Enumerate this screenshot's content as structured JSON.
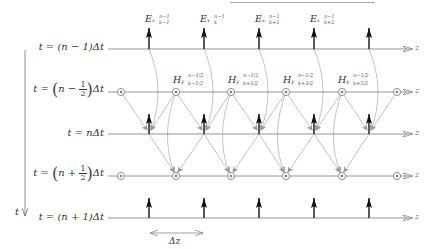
{
  "figure": {
    "title": "",
    "colors": {
      "axis_line": "#888888",
      "e_arrow": "#111111",
      "h_marker": "#777777",
      "dependency_line": "#bbbbbb",
      "dependency_arrow": "#999999",
      "top_rule": "#999999"
    },
    "time_axis": {
      "label": "t",
      "direction": "down"
    },
    "rows": [
      {
        "label": "t = (n − 1)Δt",
        "kind": "E",
        "y": 49
      },
      {
        "label_prefix": "t = ",
        "label_frac_num": "1",
        "label_frac_den": "2",
        "label_inner_left": "n − ",
        "label_suffix": "Δt",
        "kind": "H",
        "y": 92,
        "display": "t = (n − 1/2)Δt"
      },
      {
        "label": "t = nΔt",
        "kind": "E",
        "y": 134
      },
      {
        "label_prefix": "t = ",
        "label_frac_num": "1",
        "label_frac_den": "2",
        "label_inner_left": "n + ",
        "label_suffix": "Δt",
        "kind": "H",
        "y": 176,
        "display": "t = (n + 1/2)Δt"
      },
      {
        "label": "t = (n + 1)Δt",
        "kind": "E",
        "y": 218
      }
    ],
    "z_axis_label": "z",
    "e_positions_x": [
      149,
      204,
      259,
      314,
      369
    ],
    "h_positions_x": [
      121,
      176,
      231,
      286,
      342,
      397
    ],
    "e_labels": [
      {
        "base": "Ex",
        "sup": "n−1",
        "sub": "k−1"
      },
      {
        "base": "Ex",
        "sup": "n−1",
        "sub": "k"
      },
      {
        "base": "Ex",
        "sup": "n−1",
        "sub": "k+1"
      },
      {
        "base": "Ex",
        "sup": "n−1",
        "sub": "k+2"
      }
    ],
    "h_labels": [
      {
        "base": "Hy",
        "sup": "n−1/2",
        "sub": "k−1/2"
      },
      {
        "base": "Hy",
        "sup": "n−1/2",
        "sub": "k+1/2"
      },
      {
        "base": "Hy",
        "sup": "n−1/2",
        "sub": "k+3/2"
      },
      {
        "base": "Hy",
        "sup": "n−1/2",
        "sub": "k+5/2"
      }
    ],
    "spacing_label": "Δz"
  }
}
